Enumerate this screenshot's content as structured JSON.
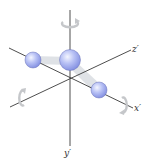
{
  "diagram": {
    "axes": [
      {
        "id": "x",
        "label": "x′"
      },
      {
        "id": "y",
        "label": "y′"
      },
      {
        "id": "z",
        "label": "z′"
      }
    ],
    "atoms": [
      {
        "id": "center",
        "role": "central atom"
      },
      {
        "id": "left",
        "role": "terminal atom"
      },
      {
        "id": "right",
        "role": "terminal atom"
      }
    ],
    "colors": {
      "axis": "#3a3a3a",
      "atom_fill": "#aab4f0",
      "bond": "#d8dbe0",
      "rotation_arrow": "#c8cacc"
    }
  }
}
